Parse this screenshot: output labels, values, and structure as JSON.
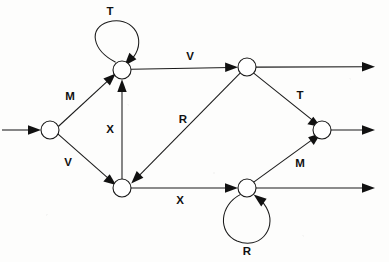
{
  "diagram": {
    "type": "state-transition-diagram",
    "width": 389,
    "height": 262,
    "background_color": "#fdfdfc",
    "stroke_color": "#1a1a1a",
    "node_fill_color": "#ffffff",
    "node_radius": 9,
    "nodes": [
      {
        "id": "n-left",
        "name": "left-node",
        "cx": 50,
        "cy": 130
      },
      {
        "id": "n-top-left",
        "name": "top-left-node",
        "cx": 122,
        "cy": 70
      },
      {
        "id": "n-bottom-left",
        "name": "bottom-left-node",
        "cx": 122,
        "cy": 188
      },
      {
        "id": "n-top-right",
        "name": "top-right-node",
        "cx": 247,
        "cy": 67
      },
      {
        "id": "n-bottom-right",
        "name": "bottom-right-node",
        "cx": 247,
        "cy": 188
      },
      {
        "id": "n-mid-right",
        "name": "mid-right-node",
        "cx": 322,
        "cy": 130
      }
    ],
    "edges": [
      {
        "id": "e-entry",
        "name": "entry-arrow",
        "label": "",
        "from": "edge-left",
        "to": "n-left"
      },
      {
        "id": "e-m1",
        "name": "edge-left-to-top-left",
        "label": "M",
        "from": "n-left",
        "to": "n-top-left",
        "label_x": 70,
        "label_y": 97
      },
      {
        "id": "e-v1",
        "name": "edge-left-to-bottom-left",
        "label": "V",
        "from": "n-left",
        "to": "n-bottom-left",
        "label_x": 68,
        "label_y": 163
      },
      {
        "id": "e-x-up",
        "name": "edge-bottom-left-to-top-left",
        "label": "X",
        "from": "n-bottom-left",
        "to": "n-top-left",
        "label_x": 110,
        "label_y": 130
      },
      {
        "id": "e-t-loop",
        "name": "self-loop-top-left",
        "label": "T",
        "from": "n-top-left",
        "to": "n-top-left",
        "label_x": 110,
        "label_y": 11
      },
      {
        "id": "e-v2",
        "name": "edge-top-left-to-top-right",
        "label": "V",
        "from": "n-top-left",
        "to": "n-top-right",
        "label_x": 190,
        "label_y": 57
      },
      {
        "id": "e-r",
        "name": "edge-top-right-to-bottom-left",
        "label": "R",
        "from": "n-top-right",
        "to": "n-bottom-left",
        "label_x": 183,
        "label_y": 120
      },
      {
        "id": "e-t2",
        "name": "edge-top-right-to-mid-right",
        "label": "T",
        "from": "n-top-right",
        "to": "n-mid-right",
        "label_x": 300,
        "label_y": 96
      },
      {
        "id": "e-x2",
        "name": "edge-bottom-left-to-bottom-right",
        "label": "X",
        "from": "n-bottom-left",
        "to": "n-bottom-right",
        "label_x": 180,
        "label_y": 200
      },
      {
        "id": "e-m2",
        "name": "edge-bottom-right-to-mid-right",
        "label": "M",
        "from": "n-bottom-right",
        "to": "n-mid-right",
        "label_x": 300,
        "label_y": 164
      },
      {
        "id": "e-r-loop",
        "name": "self-loop-bottom-right",
        "label": "R",
        "from": "n-bottom-right",
        "to": "n-bottom-right",
        "label_x": 247,
        "label_y": 252
      },
      {
        "id": "e-exit-top",
        "name": "exit-arrow-top-right",
        "label": "",
        "from": "n-top-right",
        "to": "edge-right"
      },
      {
        "id": "e-exit-mid",
        "name": "exit-arrow-mid-right",
        "label": "",
        "from": "n-mid-right",
        "to": "edge-right"
      },
      {
        "id": "e-exit-bot",
        "name": "exit-arrow-bottom-right",
        "label": "",
        "from": "n-bottom-right",
        "to": "edge-right"
      }
    ],
    "labels": [
      {
        "id": "lbl-t-top",
        "name": "label-t-top-loop",
        "text": "T",
        "x": 110,
        "y": 11
      },
      {
        "id": "lbl-m-left",
        "name": "label-m-upper-left",
        "text": "M",
        "x": 70,
        "y": 97
      },
      {
        "id": "lbl-v-left",
        "name": "label-v-lower-left",
        "text": "V",
        "x": 68,
        "y": 163
      },
      {
        "id": "lbl-x-mid",
        "name": "label-x-vertical",
        "text": "X",
        "x": 110,
        "y": 130
      },
      {
        "id": "lbl-v-top",
        "name": "label-v-top",
        "text": "V",
        "x": 190,
        "y": 57
      },
      {
        "id": "lbl-r-diag",
        "name": "label-r-diagonal",
        "text": "R",
        "x": 183,
        "y": 120
      },
      {
        "id": "lbl-t-right",
        "name": "label-t-upper-right",
        "text": "T",
        "x": 300,
        "y": 96
      },
      {
        "id": "lbl-x-bottom",
        "name": "label-x-bottom",
        "text": "X",
        "x": 180,
        "y": 200
      },
      {
        "id": "lbl-m-right",
        "name": "label-m-lower-right",
        "text": "M",
        "x": 300,
        "y": 164
      },
      {
        "id": "lbl-r-loop",
        "name": "label-r-bottom-loop",
        "text": "R",
        "x": 247,
        "y": 252
      }
    ]
  }
}
